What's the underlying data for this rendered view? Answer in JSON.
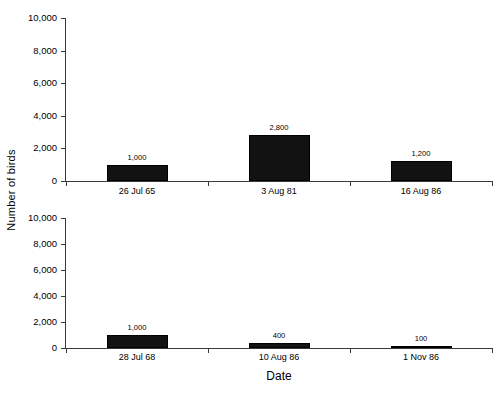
{
  "figure": {
    "ylabel": "Number of birds",
    "xlabel": "Date"
  },
  "chart_data": {
    "type": "bar",
    "title": "",
    "xlabel": "Date",
    "ylabel": "Number of birds",
    "ylim": [
      0,
      10000
    ],
    "ytick_labels": [
      "10,000",
      "8,000",
      "6,000",
      "4,000",
      "2,000",
      "0"
    ],
    "ytick_values": [
      10000,
      8000,
      6000,
      4000,
      2000,
      0
    ],
    "grid": false,
    "legend": "none",
    "panels": [
      {
        "name": "top",
        "categories": [
          "26 Jul 65",
          "3 Aug 81",
          "16 Aug 86"
        ],
        "values": [
          1000,
          2800,
          1200
        ],
        "value_labels": [
          "1,000",
          "2,800",
          "1,200"
        ],
        "ylim": [
          0,
          10000
        ]
      },
      {
        "name": "bottom",
        "categories": [
          "28 Jul 68",
          "10 Aug 86",
          "1 Nov 86"
        ],
        "values": [
          1000,
          400,
          100
        ],
        "value_labels": [
          "1,000",
          "400",
          "100"
        ],
        "ylim": [
          0,
          10000
        ]
      }
    ]
  },
  "style": {
    "bar_color": "#121212",
    "axis_color": "#3a3a3a",
    "background": "#ffffff"
  }
}
